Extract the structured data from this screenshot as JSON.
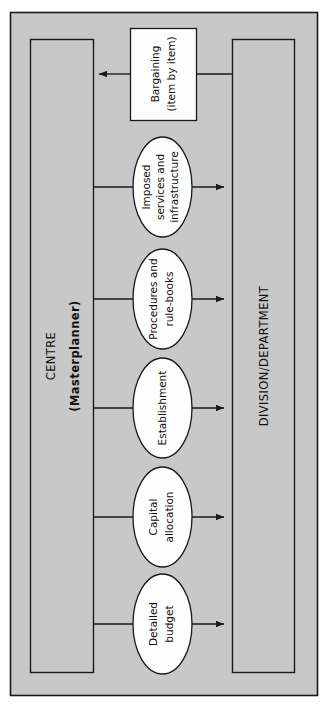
{
  "diagram": {
    "type": "flow-diagram",
    "background_color": "#c8c8c8",
    "node_fill_color": "#fdfdfd",
    "line_color": "#1a1a1a",
    "left_column": {
      "label_primary": "CENTRE",
      "label_secondary": "(Masterplanner)"
    },
    "right_column": {
      "label": "DIVISION/DEPARTMENT"
    },
    "feedback_node": {
      "line1": "Bargaining",
      "line2": "(item by item)",
      "shape": "rectangle",
      "arrow_direction": "left-to-centre"
    },
    "mechanisms": [
      {
        "id": "imposed-services",
        "shape": "ellipse",
        "lines": [
          "Imposed",
          "services and",
          "infrastructure"
        ],
        "arrow_direction": "centre-to-division"
      },
      {
        "id": "procedures-rule-books",
        "shape": "ellipse",
        "lines": [
          "Procedures and",
          "rule-books"
        ],
        "arrow_direction": "centre-to-division"
      },
      {
        "id": "establishment",
        "shape": "ellipse",
        "lines": [
          "Establishment"
        ],
        "arrow_direction": "centre-to-division"
      },
      {
        "id": "capital-allocation",
        "shape": "ellipse",
        "lines": [
          "Capital",
          "allocation"
        ],
        "arrow_direction": "centre-to-division"
      },
      {
        "id": "detailed-budget",
        "shape": "ellipse",
        "lines": [
          "Detailed",
          "budget"
        ],
        "arrow_direction": "centre-to-division"
      }
    ]
  }
}
